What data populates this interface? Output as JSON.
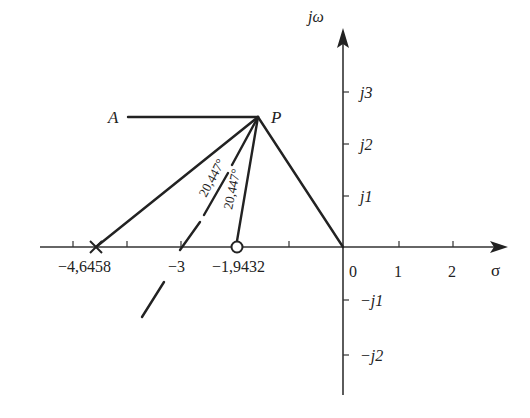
{
  "diagram": {
    "axes": {
      "real_label": "σ",
      "imag_label": "jω",
      "real_ticks": [
        "0",
        "1",
        "2"
      ],
      "imag_ticks_pos": [
        "j1",
        "j2",
        "j3"
      ],
      "imag_ticks_neg": [
        "−j1",
        "−j2"
      ]
    },
    "points": {
      "A": "A",
      "P": "P"
    },
    "real_axis_marks": {
      "pole_label": "−4,6458",
      "mid_label": "−3",
      "zero_label": "−1,9432"
    },
    "angles": {
      "angle1": "20,447°",
      "angle2": "20,447°"
    }
  }
}
